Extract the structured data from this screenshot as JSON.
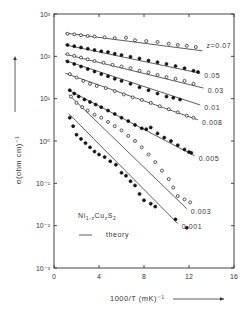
{
  "chart_data": {
    "type": "scatter",
    "title": "",
    "xlabel": "1000/T (mK)^-1",
    "ylabel": "σ (ohm cm)^-1",
    "xlim": [
      0,
      16
    ],
    "ylim_log10": [
      -3,
      3
    ],
    "y_scale": "log",
    "x_ticks": [
      "0",
      "4",
      "8",
      "12",
      "16"
    ],
    "y_ticks": [
      "10^3",
      "10^2",
      "10^1",
      "10^0",
      "10^-1",
      "10^-2",
      "10^-3"
    ],
    "legend": {
      "compound": "Ni1-zCuzS2",
      "line_label": "theory"
    },
    "series": [
      {
        "name": "z=0.07",
        "label": "z=0.07",
        "marker": "open",
        "theory": [
          [
            1.0,
            2.55
          ],
          [
            13.2,
            2.13
          ]
        ],
        "points_log10": [
          [
            1.2,
            2.53
          ],
          [
            1.8,
            2.52
          ],
          [
            2.4,
            2.5
          ],
          [
            3.0,
            2.48
          ],
          [
            3.6,
            2.47
          ],
          [
            4.5,
            2.45
          ],
          [
            5.4,
            2.43
          ],
          [
            6.4,
            2.44
          ],
          [
            7.2,
            2.38
          ],
          [
            8.2,
            2.36
          ],
          [
            9.2,
            2.34
          ],
          [
            10.2,
            2.3
          ],
          [
            11.0,
            2.27
          ],
          [
            11.8,
            2.25
          ],
          [
            12.6,
            2.22
          ]
        ]
      },
      {
        "name": "z=0.05",
        "label": "0.05",
        "marker": "filled",
        "theory": [
          [
            1.0,
            2.27
          ],
          [
            13.0,
            1.6
          ]
        ],
        "points_log10": [
          [
            1.2,
            2.27
          ],
          [
            1.8,
            2.24
          ],
          [
            2.4,
            2.21
          ],
          [
            3.0,
            2.18
          ],
          [
            3.6,
            2.15
          ],
          [
            4.2,
            2.12
          ],
          [
            4.8,
            2.1
          ],
          [
            5.4,
            2.06
          ],
          [
            6.0,
            2.03
          ],
          [
            6.8,
            1.99
          ],
          [
            7.6,
            1.95
          ],
          [
            8.4,
            1.9
          ],
          [
            9.2,
            1.86
          ],
          [
            10.0,
            1.82
          ],
          [
            10.8,
            1.77
          ],
          [
            11.6,
            1.72
          ],
          [
            12.4,
            1.66
          ],
          [
            12.8,
            1.63
          ]
        ]
      },
      {
        "name": "z=0.03",
        "label": "0.03",
        "marker": "open",
        "theory": [
          [
            1.0,
            2.05
          ],
          [
            13.3,
            1.25
          ]
        ],
        "points_log10": [
          [
            1.2,
            2.05
          ],
          [
            1.8,
            2.01
          ],
          [
            2.4,
            1.97
          ],
          [
            3.0,
            1.93
          ],
          [
            3.6,
            1.89
          ],
          [
            4.4,
            1.85
          ],
          [
            5.2,
            1.8
          ],
          [
            6.0,
            1.76
          ],
          [
            6.8,
            1.72
          ],
          [
            7.6,
            1.66
          ],
          [
            8.4,
            1.62
          ],
          [
            9.2,
            1.56
          ],
          [
            10.0,
            1.51
          ],
          [
            10.8,
            1.47
          ],
          [
            11.6,
            1.42
          ],
          [
            12.4,
            1.35
          ]
        ]
      },
      {
        "name": "z=0.01",
        "label": "0.01",
        "marker": "filled",
        "theory": [
          [
            1.0,
            1.9
          ],
          [
            13.0,
            0.85
          ]
        ],
        "points_log10": [
          [
            1.2,
            1.88
          ],
          [
            1.8,
            1.82
          ],
          [
            2.4,
            1.76
          ],
          [
            3.0,
            1.7
          ],
          [
            3.6,
            1.64
          ],
          [
            4.2,
            1.58
          ],
          [
            4.8,
            1.53
          ],
          [
            5.4,
            1.47
          ],
          [
            6.0,
            1.42
          ],
          [
            6.8,
            1.35
          ],
          [
            7.6,
            1.27
          ],
          [
            8.4,
            1.2
          ],
          [
            9.2,
            1.12
          ],
          [
            10.0,
            1.05
          ],
          [
            10.6,
            1.02
          ],
          [
            11.2,
            0.98
          ]
        ]
      },
      {
        "name": "z=0.008",
        "label": "0.008",
        "marker": "open",
        "theory": [
          [
            1.0,
            1.6
          ],
          [
            12.8,
            0.5
          ]
        ],
        "points_log10": [
          [
            1.4,
            1.58
          ],
          [
            2.0,
            1.5
          ],
          [
            2.6,
            1.42
          ],
          [
            3.2,
            1.35
          ],
          [
            3.8,
            1.3
          ],
          [
            4.6,
            1.25
          ],
          [
            5.4,
            1.18
          ],
          [
            6.2,
            1.1
          ],
          [
            7.0,
            1.03
          ],
          [
            7.8,
            0.97
          ],
          [
            8.6,
            0.9
          ],
          [
            9.4,
            0.82
          ],
          [
            10.2,
            0.75
          ],
          [
            11.0,
            0.68
          ],
          [
            11.8,
            0.6
          ],
          [
            12.4,
            0.55
          ]
        ]
      },
      {
        "name": "z=0.005",
        "label": "0.005",
        "marker": "filled",
        "theory": [
          [
            1.3,
            1.2
          ],
          [
            12.5,
            -0.35
          ]
        ],
        "points_log10": [
          [
            1.4,
            1.2
          ],
          [
            1.8,
            1.12
          ],
          [
            2.2,
            1.05
          ],
          [
            2.7,
            0.98
          ],
          [
            3.2,
            0.92
          ],
          [
            3.7,
            0.86
          ],
          [
            4.2,
            0.8
          ],
          [
            4.8,
            0.72
          ],
          [
            5.4,
            0.64
          ],
          [
            6.0,
            0.55
          ],
          [
            6.6,
            0.47
          ],
          [
            7.2,
            0.38
          ],
          [
            7.8,
            0.3
          ],
          [
            8.2,
            0.28
          ],
          [
            8.6,
            0.32
          ],
          [
            9.2,
            0.18
          ],
          [
            9.8,
            0.08
          ],
          [
            10.4,
            0.0
          ],
          [
            11.0,
            -0.1
          ],
          [
            11.6,
            -0.2
          ],
          [
            12.0,
            -0.26
          ],
          [
            12.2,
            -0.28
          ]
        ]
      },
      {
        "name": "z=0.003",
        "label": "0.003",
        "marker": "open",
        "theory": [
          [
            1.3,
            1.1
          ],
          [
            11.8,
            -1.6
          ]
        ],
        "points_log10": [
          [
            1.5,
            1.05
          ],
          [
            2.0,
            0.9
          ],
          [
            2.5,
            0.8
          ],
          [
            3.0,
            0.72
          ],
          [
            3.6,
            0.62
          ],
          [
            4.2,
            0.55
          ],
          [
            4.8,
            0.45
          ],
          [
            5.4,
            0.35
          ],
          [
            6.0,
            0.25
          ],
          [
            6.6,
            0.12
          ],
          [
            7.2,
            0.0
          ],
          [
            7.8,
            -0.15
          ],
          [
            8.4,
            -0.32
          ],
          [
            9.0,
            -0.5
          ],
          [
            9.6,
            -0.7
          ],
          [
            10.2,
            -0.9
          ],
          [
            10.6,
            -1.1
          ],
          [
            11.0,
            -1.3
          ],
          [
            11.6,
            -1.38
          ],
          [
            12.1,
            -1.45
          ]
        ]
      },
      {
        "name": "z=0.001",
        "label": "0.001",
        "marker": "filled",
        "theory": [
          [
            1.3,
            0.65
          ],
          [
            11.0,
            -1.95
          ]
        ],
        "points_log10": [
          [
            1.4,
            0.55
          ],
          [
            1.7,
            0.35
          ],
          [
            2.0,
            0.15
          ],
          [
            2.4,
            0.05
          ],
          [
            2.8,
            -0.05
          ],
          [
            3.2,
            -0.15
          ],
          [
            3.6,
            -0.25
          ],
          [
            4.0,
            -0.32
          ],
          [
            4.5,
            -0.38
          ],
          [
            5.0,
            -0.48
          ],
          [
            5.5,
            -0.56
          ],
          [
            6.0,
            -0.75
          ],
          [
            6.4,
            -0.82
          ],
          [
            6.8,
            -0.95
          ],
          [
            7.2,
            -1.05
          ],
          [
            7.6,
            -1.25
          ],
          [
            8.0,
            -1.4
          ],
          [
            8.6,
            -1.48
          ],
          [
            9.0,
            -1.55
          ],
          [
            10.8,
            -1.85
          ],
          [
            11.8,
            -2.05
          ]
        ]
      }
    ]
  }
}
